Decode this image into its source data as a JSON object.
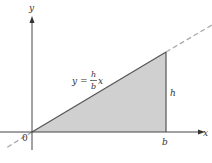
{
  "diagram": {
    "axes": {
      "x_label": "x",
      "y_label": "y",
      "origin_label": "0"
    },
    "triangle": {
      "base_label": "b",
      "height_label": "h",
      "fill": "#d0d0d0",
      "edge": "#666666"
    },
    "line_equation": {
      "lhs": "y",
      "equals": "=",
      "numerator": "h",
      "denominator": "b",
      "var": "x"
    },
    "dashed_line_color": "#aaaaaa"
  }
}
